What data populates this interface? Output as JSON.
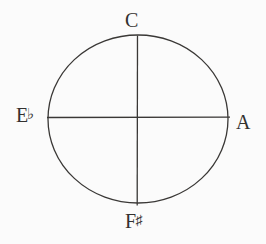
{
  "diagram": {
    "shape": "circle",
    "background_color": "#fbfbfb",
    "ink_color": "#3a3836",
    "line_color": "#3a3836",
    "center": {
      "x": 138,
      "y": 118
    },
    "radius": {
      "rx": 90,
      "ry": 84
    },
    "axes": [
      {
        "name": "vertical-diameter",
        "from": {
          "x": 138,
          "y": 35
        },
        "to": {
          "x": 138,
          "y": 205
        }
      },
      {
        "name": "horizontal-diameter",
        "from": {
          "x": 47,
          "y": 117
        },
        "to": {
          "x": 230,
          "y": 117
        }
      }
    ],
    "labels": {
      "top": {
        "note": "C",
        "accidental": "",
        "position": "top"
      },
      "left": {
        "note": "E",
        "accidental": "♭",
        "position": "left"
      },
      "right": {
        "note": "A",
        "accidental": "",
        "position": "right"
      },
      "bottom": {
        "note": "F",
        "accidental": "♯",
        "position": "bottom"
      }
    }
  }
}
